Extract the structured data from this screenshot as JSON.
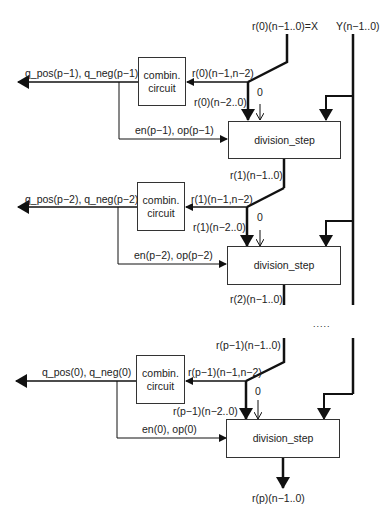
{
  "diagram": {
    "top_inputs": {
      "x": "r(0)(n−1..0)=X",
      "y": "Y(n−1..0)"
    },
    "stages": [
      {
        "combin_label_1": "combin.",
        "combin_label_2": "circuit",
        "q_out": "q_pos(p−1), q_neg(p−1)",
        "r_top": "r(0)(n−1,n−2)",
        "r_low": "r(0)(n−2..0)",
        "zero": "0",
        "en_op": "en(p−1), op(p−1)",
        "div_label": "division_step",
        "r_out": "r(1)(n−1..0)"
      },
      {
        "combin_label_1": "combin.",
        "combin_label_2": "circuit",
        "q_out": "q_pos(p−2), q_neg(p−2)",
        "r_top": "r(1)(n−1,n−2)",
        "r_low": "r(1)(n−2..0)",
        "zero": "0",
        "en_op": "en(p−2), op(p−2)",
        "div_label": "division_step",
        "r_out": "r(2)(n−1..0)"
      },
      {
        "r_in": "r(p−1)(n−1..0)",
        "combin_label_1": "combin.",
        "combin_label_2": "circuit",
        "q_out": "q_pos(0), q_neg(0)",
        "r_top": "r(p−1)(n−1,n−2)",
        "r_low": "r(p−1)(n−2..0)",
        "zero": "0",
        "en_op": "en(0), op(0)",
        "div_label": "division_step",
        "r_out": "r(p)(n−1..0)"
      }
    ],
    "ellipsis": "....."
  }
}
